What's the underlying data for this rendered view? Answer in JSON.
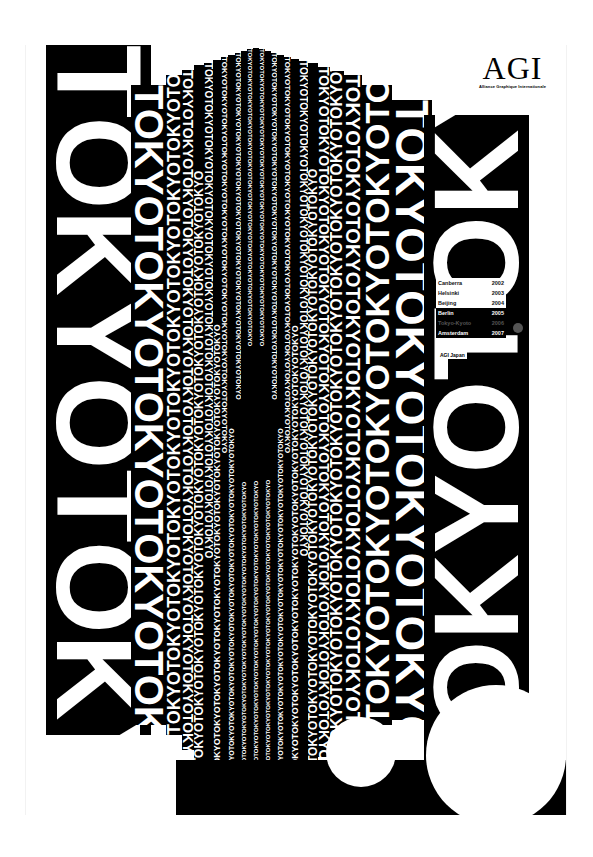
{
  "poster": {
    "title_word_a": "TOKYO",
    "title_word_b": "KYOTO",
    "repeat_text": "TOKYOTOKYOTOKYOTOKYOTOKYOTOKYOTOKYOTOKYOTOKYOTOKYOTOKYOTOKYOTOKYOTOKYO",
    "colors": {
      "ink": "#000000",
      "paper": "#ffffff",
      "accent_dot": "#555555"
    }
  },
  "logo": {
    "mark": "AGI",
    "subtitle": "Alliance Graphique Internationale"
  },
  "congress_list": [
    {
      "city": "Canberra",
      "year": "2002",
      "style": "light"
    },
    {
      "city": "Helsinki",
      "year": "2003",
      "style": "light"
    },
    {
      "city": "Beijing",
      "year": "2004",
      "style": "light"
    },
    {
      "city": "Berlin",
      "year": "2005",
      "style": "dark"
    },
    {
      "city": "Tokyo-Kyoto",
      "year": "2006",
      "style": "dim"
    },
    {
      "city": "Amsterdam",
      "year": "2007",
      "style": "dark"
    }
  ],
  "organizer": "AGI Japan"
}
